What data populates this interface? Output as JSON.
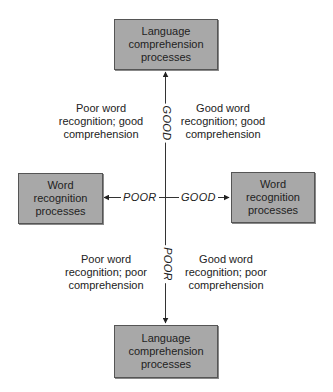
{
  "diagram": {
    "boxes": {
      "top": {
        "lines": [
          "Language",
          "comprehension",
          "processes"
        ]
      },
      "bottom": {
        "lines": [
          "Language",
          "comprehension",
          "processes"
        ]
      },
      "left": {
        "lines": [
          "Word",
          "recognition",
          "processes"
        ]
      },
      "right": {
        "lines": [
          "Word",
          "recognition",
          "processes"
        ]
      }
    },
    "axis_labels": {
      "up": "GOOD",
      "down": "POOR",
      "left": "POOR",
      "right": "GOOD"
    },
    "quadrants": {
      "top_left": {
        "lines": [
          "Poor word",
          "recognition; good",
          "comprehension"
        ]
      },
      "top_right": {
        "lines": [
          "Good word",
          "recognition; good",
          "comprehension"
        ]
      },
      "bottom_left": {
        "lines": [
          "Poor word",
          "recognition; poor",
          "comprehension"
        ]
      },
      "bottom_right": {
        "lines": [
          "Good word",
          "recognition; poor",
          "comprehension"
        ]
      }
    },
    "colors": {
      "box_fill": "#a8a8a8",
      "box_border": "#555555",
      "line": "#333333"
    }
  }
}
